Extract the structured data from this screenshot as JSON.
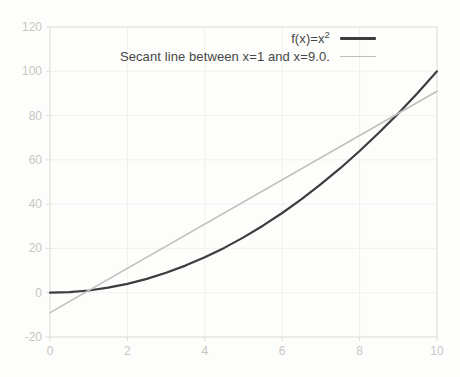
{
  "figure": {
    "background": "#fdfdfc"
  },
  "chart_data": {
    "type": "line",
    "title": "",
    "xlabel": "",
    "ylabel": "",
    "xlim": [
      0,
      10
    ],
    "ylim": [
      -20,
      120
    ],
    "x_ticks": [
      0,
      2,
      4,
      6,
      8,
      10
    ],
    "y_ticks": [
      -20,
      0,
      20,
      40,
      60,
      80,
      100,
      120
    ],
    "grid": true,
    "legend_position": "top-right",
    "colors": {
      "grid": "#f1f0ef",
      "border": "#e3e1df",
      "tick": "#dddbd9",
      "tick_label": "#c8c6c4",
      "legend_text": "#474747"
    },
    "legend": [
      {
        "base": "f(x)=x",
        "sup": "2"
      },
      {
        "base": "Secant line between x=1 and x=9.0.",
        "sup": ""
      }
    ],
    "series": [
      {
        "name": "f(x)=x^2",
        "color": "#3d3d3d",
        "stroke_width": 2.2,
        "x": [
          0,
          0.5,
          1,
          1.5,
          2,
          2.5,
          3,
          3.5,
          4,
          4.5,
          5,
          5.5,
          6,
          6.5,
          7,
          7.5,
          8,
          8.5,
          9,
          9.5,
          10
        ],
        "y": [
          0,
          0.25,
          1,
          2.25,
          4,
          6.25,
          9,
          12.25,
          16,
          20.25,
          25,
          30.25,
          36,
          42.25,
          49,
          56.25,
          64,
          72.25,
          81,
          90.25,
          100
        ]
      },
      {
        "name": "Secant line between x=1 and x=9.0.",
        "color": "#c0bfbe",
        "stroke_width": 1.6,
        "x": [
          0,
          10
        ],
        "y": [
          -9,
          91
        ]
      }
    ]
  }
}
